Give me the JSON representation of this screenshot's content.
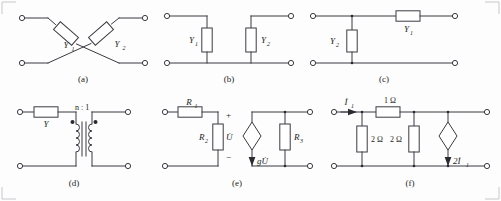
{
  "figure": {
    "width": 501,
    "height": 201,
    "ink_color": "#3a3a42",
    "background": "#fdfdfd"
  },
  "panels": [
    {
      "id": "a",
      "caption": "(a)",
      "type": "lattice-bridge-network",
      "elements": [
        {
          "name": "admittance-y1",
          "label": "Y",
          "subscript": "1"
        },
        {
          "name": "admittance-y2",
          "label": "Y",
          "subscript": "2"
        }
      ],
      "terminals": 4
    },
    {
      "id": "b",
      "caption": "(b)",
      "type": "two-shunt-branches",
      "elements": [
        {
          "name": "admittance-y1",
          "label": "Y",
          "subscript": "1"
        },
        {
          "name": "admittance-y2",
          "label": "Y",
          "subscript": "2"
        }
      ],
      "terminals": 4
    },
    {
      "id": "c",
      "caption": "(c)",
      "type": "l-section-network",
      "elements": [
        {
          "name": "admittance-y1",
          "label": "Y",
          "subscript": "1"
        },
        {
          "name": "admittance-y2",
          "label": "Y",
          "subscript": "2"
        }
      ],
      "terminals": 4
    },
    {
      "id": "d",
      "caption": "(d)",
      "type": "admittance-with-ideal-transformer",
      "elements": [
        {
          "name": "admittance-y",
          "label": "Y",
          "subscript": ""
        },
        {
          "name": "transformer-ratio",
          "label": "n : 1",
          "subscript": ""
        }
      ],
      "terminals": 4
    },
    {
      "id": "e",
      "caption": "(e)",
      "type": "vccs-dependent-source-network",
      "elements": [
        {
          "name": "resistor-r1",
          "label": "R",
          "subscript": "1"
        },
        {
          "name": "resistor-r2",
          "label": "R",
          "subscript": "2"
        },
        {
          "name": "resistor-r3",
          "label": "R",
          "subscript": "3"
        },
        {
          "name": "voltage-u",
          "label": "U̇",
          "subscript": ""
        },
        {
          "name": "dependent-current-source",
          "label": "gU̇",
          "subscript": ""
        },
        {
          "name": "polarity-plus",
          "label": "+",
          "subscript": ""
        },
        {
          "name": "polarity-minus",
          "label": "−",
          "subscript": ""
        }
      ],
      "terminals": 4
    },
    {
      "id": "f",
      "caption": "(f)",
      "type": "cccs-resistive-network",
      "elements": [
        {
          "name": "series-resistor",
          "label": "1 Ω",
          "subscript": ""
        },
        {
          "name": "shunt-resistor-left",
          "label": "2 Ω",
          "subscript": ""
        },
        {
          "name": "shunt-resistor-right",
          "label": "2 Ω",
          "subscript": ""
        },
        {
          "name": "input-current",
          "label": "İ",
          "subscript": "1"
        },
        {
          "name": "dependent-current-source",
          "label": "2İ",
          "subscript": "1"
        }
      ],
      "terminals": 4
    }
  ],
  "labels": {
    "y": "Y",
    "r": "R",
    "i": "İ",
    "u": "U̇",
    "one": "1",
    "two": "2",
    "three": "3",
    "plus": "+",
    "minus": "−",
    "transformer_ratio": "n : 1",
    "ohm_1": "1 Ω",
    "ohm_2a": "2 Ω",
    "ohm_2b": "2 Ω",
    "g_u": "gU̇",
    "two_i": "2İ",
    "cap_a": "(a)",
    "cap_b": "(b)",
    "cap_c": "(c)",
    "cap_d": "(d)",
    "cap_e": "(e)",
    "cap_f": "(f)"
  }
}
